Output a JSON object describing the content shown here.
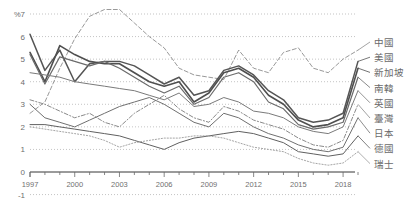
{
  "chart_data": {
    "type": "line",
    "title": "",
    "subtitle": "",
    "xlabel": "",
    "ylabel": "%",
    "unit_label": "%",
    "xlim": [
      1997,
      2019
    ],
    "ylim": [
      -1,
      7
    ],
    "yticks": [
      7,
      6,
      5,
      4,
      3,
      2,
      1,
      0,
      -1
    ],
    "ytick_labels": [
      "7",
      "6",
      "5",
      "4",
      "3",
      "2",
      "1",
      "0",
      "-1"
    ],
    "grid": true,
    "grid_style": "dotted",
    "legend_position": "right",
    "x": [
      1997,
      1998,
      1999,
      2000,
      2001,
      2002,
      2003,
      2004,
      2005,
      2006,
      2007,
      2008,
      2009,
      2010,
      2011,
      2012,
      2013,
      2014,
      2015,
      2016,
      2017,
      2018,
      2019
    ],
    "xticks": [
      1997,
      1998,
      1999,
      2000,
      2001,
      2002,
      2003,
      2004,
      2005,
      2006,
      2007,
      2008,
      2009,
      2010,
      2011,
      2012,
      2013,
      2014,
      2015,
      2016,
      2017,
      2018,
      2019
    ],
    "xtick_labels_shown": [
      "1997",
      "2000",
      "2003",
      "2006",
      "2009",
      "2012",
      "2015",
      "2018"
    ],
    "xtick_labels_years": [
      1997,
      2000,
      2003,
      2006,
      2009,
      2012,
      2015,
      2018
    ],
    "series": [
      {
        "name": "中國",
        "style": "dashed",
        "color": "#8d8d8d",
        "width": 0.9,
        "values": [
          2.6,
          3.1,
          4.6,
          5.9,
          6.9,
          7.2,
          7.2,
          6.6,
          6.0,
          5.5,
          4.6,
          4.3,
          4.2,
          4.1,
          5.4,
          4.6,
          4.4,
          5.3,
          5.5,
          4.6,
          4.4,
          5.0,
          5.4
        ]
      },
      {
        "name": "美國",
        "style": "solid",
        "color": "#555555",
        "width": 1.5,
        "values": [
          6.1,
          4.5,
          5.4,
          4.0,
          4.8,
          4.9,
          4.9,
          4.7,
          4.3,
          3.9,
          4.2,
          3.4,
          3.6,
          4.5,
          4.7,
          4.3,
          3.6,
          3.2,
          2.4,
          2.2,
          2.3,
          2.6,
          4.9
        ]
      },
      {
        "name": "新加坡",
        "style": "solid",
        "color": "#4f4f4f",
        "width": 1.6,
        "values": [
          5.3,
          4.0,
          5.6,
          5.2,
          4.9,
          4.8,
          4.8,
          4.4,
          4.0,
          3.8,
          4.0,
          3.1,
          3.5,
          4.4,
          4.6,
          4.2,
          3.4,
          3.0,
          2.3,
          2.0,
          2.1,
          2.4,
          4.6
        ]
      },
      {
        "name": "南韓",
        "style": "solid",
        "color": "#6b6b6b",
        "width": 1.2,
        "values": [
          5.2,
          3.9,
          5.1,
          4.9,
          4.7,
          4.9,
          4.6,
          4.2,
          3.8,
          3.5,
          3.8,
          3.0,
          3.3,
          4.2,
          4.4,
          4.0,
          3.1,
          2.8,
          2.1,
          1.9,
          2.0,
          2.2,
          4.2
        ]
      },
      {
        "name": "英國",
        "style": "solid",
        "color": "#7a7a7a",
        "width": 1.0,
        "values": [
          4.4,
          4.3,
          4.2,
          4.0,
          3.9,
          3.8,
          3.7,
          3.6,
          3.4,
          3.2,
          3.5,
          2.9,
          3.0,
          3.3,
          3.1,
          2.7,
          2.6,
          2.4,
          2.0,
          1.8,
          1.7,
          2.0,
          3.6
        ]
      },
      {
        "name": "臺灣",
        "style": "dashdot",
        "color": "#8a8a8a",
        "width": 1.0,
        "values": [
          3.2,
          3.0,
          2.7,
          2.4,
          2.6,
          2.2,
          2.0,
          2.6,
          3.0,
          3.4,
          2.8,
          2.4,
          2.2,
          2.9,
          2.7,
          2.3,
          2.1,
          1.9,
          1.5,
          1.2,
          1.1,
          1.4,
          3.0
        ]
      },
      {
        "name": "日本",
        "style": "solid",
        "color": "#707070",
        "width": 1.0,
        "values": [
          3.0,
          2.4,
          2.2,
          2.0,
          2.3,
          2.6,
          2.9,
          3.1,
          3.3,
          3.0,
          2.6,
          2.2,
          2.0,
          2.6,
          2.4,
          2.0,
          1.7,
          1.5,
          1.2,
          1.0,
          0.9,
          1.1,
          2.4
        ]
      },
      {
        "name": "德國",
        "style": "solid",
        "color": "#606060",
        "width": 1.0,
        "values": [
          2.1,
          2.1,
          2.0,
          1.9,
          1.8,
          1.7,
          1.6,
          1.4,
          1.2,
          1.0,
          1.3,
          1.5,
          1.6,
          1.7,
          1.8,
          1.7,
          1.5,
          1.3,
          0.9,
          0.8,
          0.7,
          0.8,
          1.6
        ]
      },
      {
        "name": "瑞士",
        "style": "dotted",
        "color": "#9a9a9a",
        "width": 0.9,
        "values": [
          2.0,
          1.9,
          1.8,
          1.7,
          1.6,
          1.4,
          1.1,
          1.3,
          1.4,
          1.5,
          1.5,
          1.6,
          1.6,
          1.5,
          1.3,
          1.1,
          1.0,
          0.9,
          0.6,
          0.4,
          0.3,
          0.4,
          0.9
        ]
      }
    ]
  },
  "legend": {
    "items": [
      {
        "label": "中國"
      },
      {
        "label": "美國"
      },
      {
        "label": "新加坡"
      },
      {
        "label": "南韓"
      },
      {
        "label": "英國"
      },
      {
        "label": "臺灣"
      },
      {
        "label": "日本"
      },
      {
        "label": "德國"
      },
      {
        "label": "瑞士"
      }
    ]
  },
  "axis": {
    "unit": "%",
    "y_labels": [
      "7",
      "6",
      "5",
      "4",
      "3",
      "2",
      "1",
      "0",
      "-1"
    ],
    "x_labels": [
      "1997",
      "2000",
      "2003",
      "2006",
      "2009",
      "2012",
      "2015",
      "2018"
    ]
  }
}
